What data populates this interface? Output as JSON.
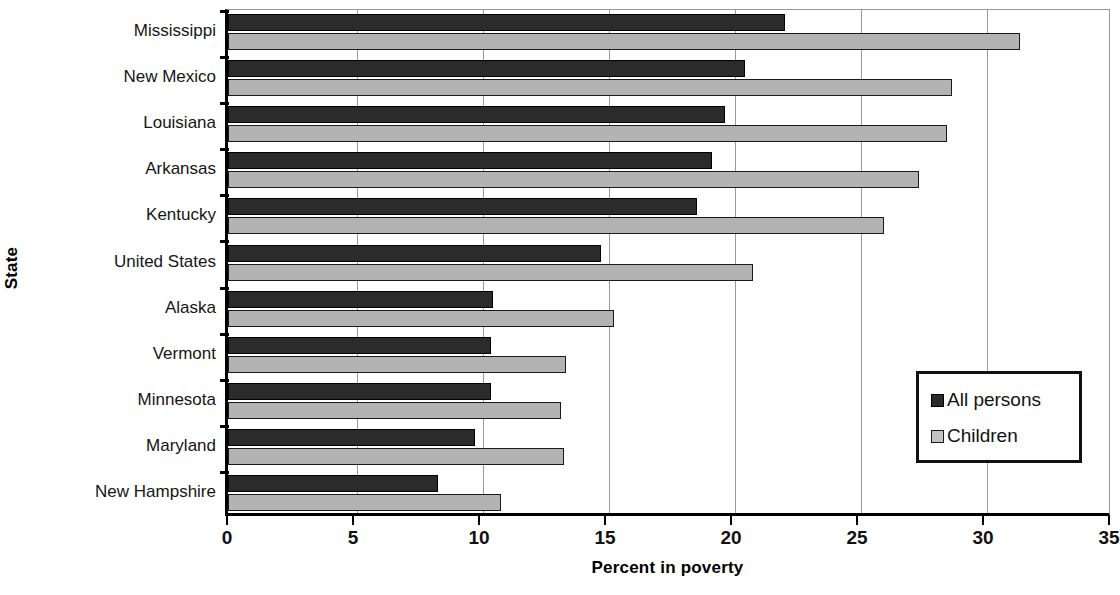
{
  "chart_data": {
    "type": "bar",
    "orientation": "horizontal",
    "title": "",
    "xlabel": "Percent in poverty",
    "ylabel": "State",
    "xlim": [
      0,
      35
    ],
    "xticks": [
      0,
      5,
      10,
      15,
      20,
      25,
      30,
      35
    ],
    "grid": true,
    "legend_position": "right-inside",
    "categories": [
      "Mississippi",
      "New Mexico",
      "Louisiana",
      "Arkansas",
      "Kentucky",
      "United States",
      "Alaska",
      "Vermont",
      "Minnesota",
      "Maryland",
      "New Hampshire"
    ],
    "series": [
      {
        "name": "All persons",
        "color": "#2b2b2b",
        "values": [
          22.0,
          20.4,
          19.6,
          19.1,
          18.5,
          14.7,
          10.4,
          10.3,
          10.3,
          9.7,
          8.2
        ]
      },
      {
        "name": "Children",
        "color": "#b3b3b3",
        "values": [
          31.3,
          28.6,
          28.4,
          27.3,
          25.9,
          20.7,
          15.2,
          13.3,
          13.1,
          13.2,
          10.7
        ]
      }
    ]
  },
  "axes": {
    "x_title": "Percent in poverty",
    "y_title": "State",
    "x_tick_labels": [
      "0",
      "5",
      "10",
      "15",
      "20",
      "25",
      "30",
      "35"
    ]
  },
  "legend": {
    "items": [
      {
        "label": "All persons",
        "swatch": "dark-square-swatch"
      },
      {
        "label": "Children",
        "swatch": "light-square-swatch"
      }
    ]
  }
}
